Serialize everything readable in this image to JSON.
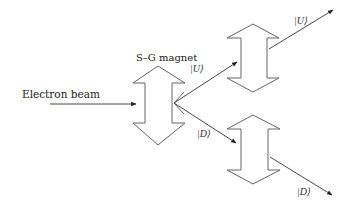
{
  "figure": {
    "source_label": "Electron beam",
    "magnet_label": "S–G magnet",
    "magnets": [
      {
        "id": "sg1",
        "role": "primary",
        "label": "S–G magnet"
      },
      {
        "id": "sg2",
        "role": "upper-branch"
      },
      {
        "id": "sg3",
        "role": "lower-branch"
      }
    ],
    "beam_labels": {
      "first_up": "|U⟩",
      "first_down": "|D⟩",
      "second_up": "|U⟩",
      "third_down": "|D⟩"
    },
    "colors": {
      "background": "#ffffff",
      "stroke": "#666666",
      "text": "#222222"
    }
  }
}
